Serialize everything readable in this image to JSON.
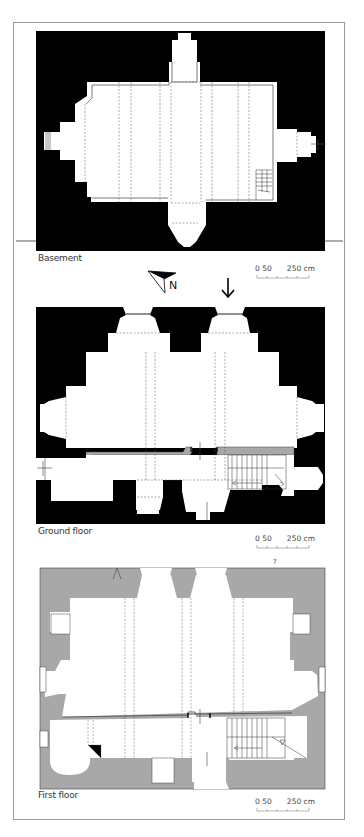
{
  "figure": {
    "panels": [
      {
        "id": "basement",
        "label": "Basement",
        "scale": {
          "start": "0",
          "mid": "50",
          "end": "250 cm"
        }
      },
      {
        "id": "ground",
        "label": "Ground floor",
        "scale": {
          "start": "0",
          "mid": "50",
          "end": "250 cm"
        }
      },
      {
        "id": "first",
        "label": "First floor",
        "scale": {
          "start": "0",
          "mid": "50",
          "end": "250 cm"
        }
      }
    ],
    "compass": {
      "letter": "N"
    },
    "annotation_question": "?",
    "colors": {
      "wall_black": "#000000",
      "wall_grey": "#a8a8a8",
      "frame": "#9a9a9a",
      "line": "#555555"
    }
  }
}
